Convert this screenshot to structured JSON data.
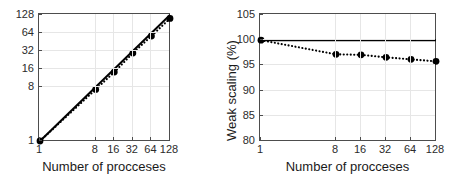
{
  "figure": {
    "background": "#ffffff",
    "axis_color": "#4d4d4d",
    "grid_color": "#e6e6e6",
    "data_color": "#000000"
  },
  "chart_data": [
    {
      "type": "line",
      "id": "strong-scaling",
      "title": "",
      "xlabel": "Number of procceses",
      "ylabel": "",
      "xscale": "log2",
      "yscale": "log2",
      "xlim": [
        1,
        128
      ],
      "ylim": [
        1,
        128
      ],
      "xticks": [
        1,
        8,
        16,
        32,
        64,
        128
      ],
      "xticklabels": [
        "1",
        "8",
        "16",
        "32",
        "64",
        "128"
      ],
      "yticks": [
        1,
        8,
        16,
        32,
        64,
        128
      ],
      "yticklabels": [
        "1",
        "8",
        "16",
        "32",
        "64",
        "128"
      ],
      "grid": true,
      "legend": "none",
      "series": [
        {
          "name": "ideal",
          "style": "solid",
          "marker": "none",
          "x": [
            1,
            128
          ],
          "values": [
            1,
            128
          ]
        },
        {
          "name": "measured",
          "style": "dotted",
          "marker": "circle-filled",
          "x": [
            1,
            8,
            16,
            32,
            64,
            128
          ],
          "values": [
            1,
            7.3,
            14.2,
            29.5,
            57,
            112
          ]
        }
      ]
    },
    {
      "type": "line",
      "id": "weak-scaling",
      "title": "",
      "xlabel": "Number of procceses",
      "ylabel": "Weak scaling (%)",
      "xscale": "log2",
      "yscale": "linear",
      "xlim": [
        1,
        128
      ],
      "ylim": [
        80,
        105
      ],
      "xticks": [
        1,
        8,
        16,
        32,
        64,
        128
      ],
      "xticklabels": [
        "1",
        "8",
        "16",
        "32",
        "64",
        "128"
      ],
      "yticks": [
        80,
        85,
        90,
        95,
        100,
        105
      ],
      "yticklabels": [
        "80",
        "85",
        "90",
        "95",
        "100",
        "105"
      ],
      "grid": true,
      "legend": "none",
      "series": [
        {
          "name": "ideal",
          "style": "solid",
          "marker": "none",
          "x": [
            1,
            128
          ],
          "values": [
            100,
            100
          ]
        },
        {
          "name": "measured",
          "style": "dotted",
          "marker": "circle-filled",
          "x": [
            1,
            8,
            16,
            32,
            64,
            128
          ],
          "values": [
            100,
            97.2,
            97.1,
            96.6,
            96.2,
            95.8
          ]
        }
      ]
    }
  ]
}
